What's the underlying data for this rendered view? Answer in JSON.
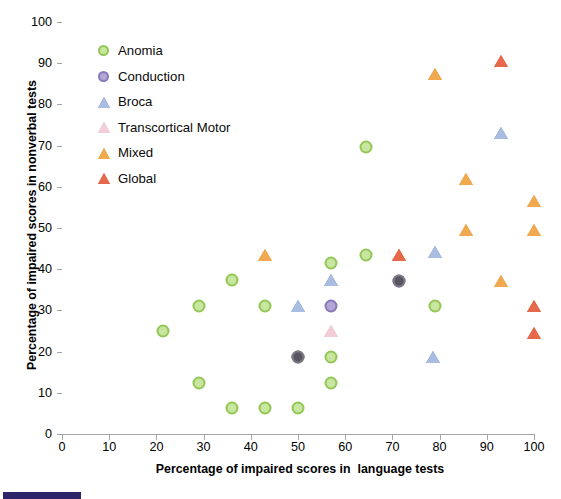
{
  "chart_data": {
    "type": "scatter",
    "title": "",
    "xlabel": "Percentage of impaired scores in  language tests",
    "ylabel": "Percentage of impaired scores in nonverbal tests",
    "xlim": [
      0,
      100
    ],
    "ylim": [
      0,
      100
    ],
    "xticks": [
      0,
      10,
      20,
      30,
      40,
      50,
      60,
      70,
      80,
      90,
      100
    ],
    "yticks": [
      0,
      10,
      20,
      30,
      40,
      50,
      60,
      70,
      80,
      90,
      100
    ],
    "grid": false,
    "legend_position": "top-left inside plot",
    "series": [
      {
        "name": "Anomia",
        "marker": "circle",
        "color": "#92c756",
        "fill": "#c9e6a0",
        "points": [
          {
            "x": 21.5,
            "y": 25.0
          },
          {
            "x": 29.0,
            "y": 31.0
          },
          {
            "x": 29.0,
            "y": 12.4
          },
          {
            "x": 36.0,
            "y": 37.3
          },
          {
            "x": 36.0,
            "y": 6.2
          },
          {
            "x": 43.0,
            "y": 31.0
          },
          {
            "x": 43.0,
            "y": 6.2
          },
          {
            "x": 50.0,
            "y": 6.2
          },
          {
            "x": 50.0,
            "y": 18.6
          },
          {
            "x": 57.0,
            "y": 41.4
          },
          {
            "x": 57.0,
            "y": 18.6
          },
          {
            "x": 57.0,
            "y": 12.4
          },
          {
            "x": 64.5,
            "y": 69.6
          },
          {
            "x": 64.5,
            "y": 43.4
          },
          {
            "x": 79.0,
            "y": 31.0
          }
        ]
      },
      {
        "name": "Conduction",
        "marker": "circle",
        "color": "#8878b8",
        "fill": "#b3a6d4",
        "points": [
          {
            "x": 50.0,
            "y": 18.6
          },
          {
            "x": 57.0,
            "y": 31.0
          },
          {
            "x": 71.5,
            "y": 37.2
          }
        ]
      },
      {
        "name": "Broca",
        "marker": "triangle",
        "color": "#5b7bb8",
        "fill": "#a8bde0",
        "points": [
          {
            "x": 50.0,
            "y": 31.0
          },
          {
            "x": 57.0,
            "y": 37.3
          },
          {
            "x": 78.5,
            "y": 18.6
          },
          {
            "x": 79.0,
            "y": 44.2
          },
          {
            "x": 93.0,
            "y": 73.0
          }
        ]
      },
      {
        "name": "Transcortical Motor",
        "marker": "triangle",
        "color": "#d9a5b8",
        "fill": "#f2cdd8",
        "points": [
          {
            "x": 57.0,
            "y": 25.0
          }
        ]
      },
      {
        "name": "Mixed",
        "marker": "triangle",
        "color": "#e08b30",
        "fill": "#f0a94e",
        "points": [
          {
            "x": 43.0,
            "y": 43.5
          },
          {
            "x": 71.5,
            "y": 43.5
          },
          {
            "x": 79.0,
            "y": 87.5
          },
          {
            "x": 85.5,
            "y": 62.0
          },
          {
            "x": 85.5,
            "y": 49.6
          },
          {
            "x": 93.0,
            "y": 37.2
          },
          {
            "x": 100.0,
            "y": 56.5
          },
          {
            "x": 100.0,
            "y": 49.6
          }
        ]
      },
      {
        "name": "Global",
        "marker": "triangle",
        "color": "#d9582f",
        "fill": "#e5694a",
        "points": [
          {
            "x": 71.5,
            "y": 43.5
          },
          {
            "x": 93.0,
            "y": 90.5
          },
          {
            "x": 100.0,
            "y": 31.0
          },
          {
            "x": 100.0,
            "y": 24.6
          }
        ]
      }
    ]
  },
  "legend": {
    "items": [
      {
        "label": "Anomia"
      },
      {
        "label": "Conduction"
      },
      {
        "label": "Broca"
      },
      {
        "label": "Transcortical Motor"
      },
      {
        "label": "Mixed"
      },
      {
        "label": "Global"
      }
    ]
  },
  "overlap_markers": [
    {
      "x": 50.0,
      "y": 18.6,
      "color": "#5a5560",
      "note": "Conduction over Anomia"
    },
    {
      "x": 71.5,
      "y": 37.2,
      "color": "#5a5560",
      "note": "Conduction dark"
    }
  ]
}
